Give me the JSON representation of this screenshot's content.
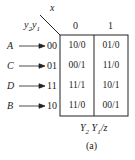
{
  "table": {
    "corner_col_var": "x",
    "corner_row_var_y2": "y",
    "corner_row_var_y2_sub": "2",
    "corner_row_var_y1": "y",
    "corner_row_var_y1_sub": "1",
    "columns": [
      "0",
      "1"
    ],
    "rows": [
      {
        "state": "A",
        "code": "00",
        "cells": [
          "10/0",
          "01/0"
        ]
      },
      {
        "state": "C",
        "code": "01",
        "cells": [
          "00/1",
          "11/0"
        ]
      },
      {
        "state": "D",
        "code": "11",
        "cells": [
          "11/1",
          "10/1"
        ]
      },
      {
        "state": "B",
        "code": "10",
        "cells": [
          "11/0",
          "00/1"
        ]
      }
    ],
    "caption_Y2": "Y",
    "caption_Y2_sub": "2",
    "caption_Y1": "Y",
    "caption_Y1_sub": "1",
    "caption_z": "/z"
  },
  "label": "(a)"
}
